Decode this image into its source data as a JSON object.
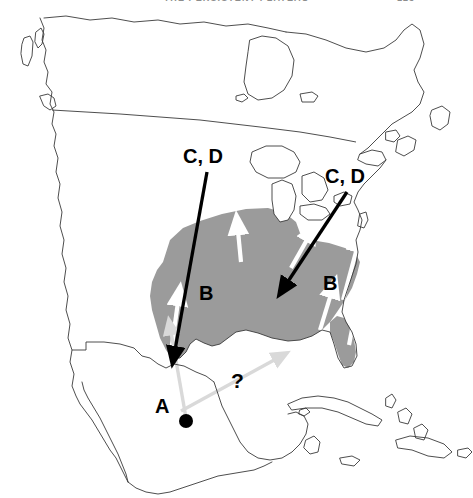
{
  "page": {
    "running_head": "THE PERSISTENT PLATEAU",
    "page_number": "125",
    "background_color": "#ffffff"
  },
  "figure": {
    "type": "distribution-migration-map",
    "region": "North America",
    "colors": {
      "range_fill": "#9b9b9b",
      "coastline": "#3a3a3a",
      "black_arrow": "#000000",
      "white_arrow": "#ffffff",
      "pale_arrow": "#d9d9d9",
      "label_text": "#000000"
    },
    "labels": [
      {
        "id": "cd-west",
        "text": "C, D",
        "x": 183,
        "y": 163
      },
      {
        "id": "cd-east",
        "text": "C, D",
        "x": 325,
        "y": 183
      },
      {
        "id": "b-central",
        "text": "B",
        "x": 199,
        "y": 300
      },
      {
        "id": "b-east",
        "text": "B",
        "x": 323,
        "y": 290
      },
      {
        "id": "a-mexico",
        "text": "A",
        "x": 155,
        "y": 413
      },
      {
        "id": "query-gulf",
        "text": "?",
        "x": 231,
        "y": 388
      }
    ],
    "point_markers": [
      {
        "id": "source-locality",
        "label": "A",
        "x": 186,
        "y": 421,
        "radius": 7,
        "color": "#000000"
      }
    ],
    "arrows": {
      "black": [
        {
          "id": "arrow-cd-west",
          "from_label": "C, D",
          "x1": 206,
          "y1": 171,
          "x2": 174,
          "y2": 355
        },
        {
          "id": "arrow-cd-east",
          "from_label": "C, D",
          "x1": 346,
          "y1": 190,
          "x2": 285,
          "y2": 285
        }
      ],
      "white": [
        {
          "id": "white-arrow-texas",
          "x1": 171,
          "y1": 352,
          "x2": 178,
          "y2": 300
        },
        {
          "id": "white-arrow-plains",
          "x1": 241,
          "y1": 262,
          "x2": 238,
          "y2": 229
        },
        {
          "id": "white-arrow-midwest",
          "x1": 291,
          "y1": 268,
          "x2": 309,
          "y2": 236
        },
        {
          "id": "white-arrow-gulfcoast",
          "x1": 320,
          "y1": 330,
          "x2": 332,
          "y2": 292
        },
        {
          "id": "white-arrow-southeast",
          "x1": 343,
          "y1": 300,
          "x2": 358,
          "y2": 245
        },
        {
          "id": "white-arrow-florida",
          "x1": 349,
          "y1": 345,
          "x2": 356,
          "y2": 312
        }
      ],
      "pale": [
        {
          "id": "pale-arrow-north",
          "x1": 186,
          "y1": 418,
          "x2": 172,
          "y2": 330
        },
        {
          "id": "pale-arrow-northeast",
          "x1": 180,
          "y1": 410,
          "x2": 278,
          "y2": 358
        }
      ]
    },
    "range_description": "Gray shaded breeding range covering the south-central and southeastern United States including Florida"
  }
}
